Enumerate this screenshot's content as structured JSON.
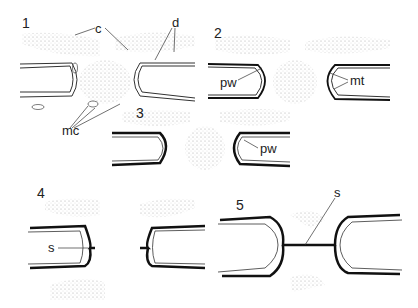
{
  "figure": {
    "panels": [
      {
        "number": "1",
        "labels": [
          "c",
          "d",
          "mc"
        ]
      },
      {
        "number": "2",
        "labels": [
          "pw",
          "mt"
        ]
      },
      {
        "number": "3",
        "labels": [
          "pw"
        ]
      },
      {
        "number": "4",
        "labels": [
          "s"
        ]
      },
      {
        "number": "5",
        "labels": [
          "s"
        ]
      }
    ],
    "p1": {
      "num": "1",
      "c": "c",
      "d": "d",
      "mc": "mc"
    },
    "p2": {
      "num": "2",
      "pw": "pw",
      "mt": "mt"
    },
    "p3": {
      "num": "3",
      "pw": "pw"
    },
    "p4": {
      "num": "4",
      "s": "s"
    },
    "p5": {
      "num": "5",
      "s": "s"
    }
  }
}
